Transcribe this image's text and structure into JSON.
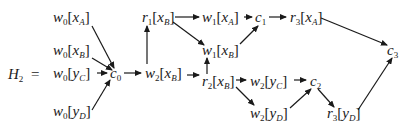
{
  "equation": {
    "lhs": "H",
    "lhs_sub": "2",
    "equals": "="
  },
  "nodes": [
    {
      "id": "w0xA",
      "op": "w",
      "sub": "0",
      "var": "x",
      "vsub": "A",
      "x": 53,
      "y": 22
    },
    {
      "id": "w0xB",
      "op": "w",
      "sub": "0",
      "var": "x",
      "vsub": "B",
      "x": 53,
      "y": 55
    },
    {
      "id": "w0yC",
      "op": "w",
      "sub": "0",
      "var": "y",
      "vsub": "C",
      "x": 53,
      "y": 78
    },
    {
      "id": "w0yD",
      "op": "w",
      "sub": "0",
      "var": "y",
      "vsub": "D",
      "x": 53,
      "y": 116
    },
    {
      "id": "c0",
      "op": "c",
      "sub": "0",
      "x": 110,
      "y": 78
    },
    {
      "id": "w2xB",
      "op": "w",
      "sub": "2",
      "var": "x",
      "vsub": "B",
      "x": 145,
      "y": 78
    },
    {
      "id": "r1xB",
      "op": "r",
      "sub": "1",
      "var": "x",
      "vsub": "B",
      "x": 142,
      "y": 22
    },
    {
      "id": "w1xA",
      "op": "w",
      "sub": "1",
      "var": "x",
      "vsub": "A",
      "x": 202,
      "y": 22
    },
    {
      "id": "c1",
      "op": "c",
      "sub": "1",
      "x": 255,
      "y": 22
    },
    {
      "id": "r3xA",
      "op": "r",
      "sub": "3",
      "var": "x",
      "vsub": "A",
      "x": 290,
      "y": 22
    },
    {
      "id": "w1xB",
      "op": "w",
      "sub": "1",
      "var": "x",
      "vsub": "B",
      "x": 202,
      "y": 55
    },
    {
      "id": "r2xB",
      "op": "r",
      "sub": "2",
      "var": "x",
      "vsub": "B",
      "x": 202,
      "y": 86
    },
    {
      "id": "w2yC",
      "op": "w",
      "sub": "2",
      "var": "y",
      "vsub": "C",
      "x": 250,
      "y": 86
    },
    {
      "id": "c2",
      "op": "c",
      "sub": "2",
      "x": 310,
      "y": 86
    },
    {
      "id": "w2yD",
      "op": "w",
      "sub": "2",
      "var": "y",
      "vsub": "D",
      "x": 250,
      "y": 118
    },
    {
      "id": "r3yD",
      "op": "r",
      "sub": "3",
      "var": "y",
      "vsub": "D",
      "x": 327,
      "y": 118
    },
    {
      "id": "c3",
      "op": "c",
      "sub": "3",
      "x": 387,
      "y": 55
    }
  ],
  "edges": [
    {
      "from": "w0xA",
      "to": "c0",
      "x1": 92,
      "y1": 26,
      "x2": 114,
      "y2": 68
    },
    {
      "from": "w0xB",
      "to": "c0",
      "x1": 92,
      "y1": 58,
      "x2": 112,
      "y2": 70
    },
    {
      "from": "w0yC",
      "to": "c0",
      "x1": 97,
      "y1": 73,
      "x2": 107,
      "y2": 73
    },
    {
      "from": "w0yD",
      "to": "c0",
      "x1": 92,
      "y1": 110,
      "x2": 110,
      "y2": 80
    },
    {
      "from": "c0",
      "to": "w2xB",
      "x1": 124,
      "y1": 73,
      "x2": 141,
      "y2": 73
    },
    {
      "from": "w2xB",
      "to": "r1xB",
      "x1": 147,
      "y1": 64,
      "x2": 147,
      "y2": 26
    },
    {
      "from": "w2xB",
      "to": "r2xB",
      "x1": 187,
      "y1": 75,
      "x2": 199,
      "y2": 75
    },
    {
      "from": "r1xB",
      "to": "w1xA",
      "x1": 175,
      "y1": 17,
      "x2": 199,
      "y2": 17
    },
    {
      "from": "r1xB",
      "to": "w1xB",
      "x1": 173,
      "y1": 22,
      "x2": 204,
      "y2": 45
    },
    {
      "from": "w1xA",
      "to": "c1",
      "x1": 244,
      "y1": 17,
      "x2": 252,
      "y2": 17
    },
    {
      "from": "w1xB",
      "to": "c1",
      "x1": 240,
      "y1": 44,
      "x2": 258,
      "y2": 26
    },
    {
      "from": "c1",
      "to": "r3xA",
      "x1": 269,
      "y1": 17,
      "x2": 286,
      "y2": 17
    },
    {
      "from": "r2xB",
      "to": "w1xB",
      "x1": 207,
      "y1": 74,
      "x2": 207,
      "y2": 58
    },
    {
      "from": "r2xB",
      "to": "w2yC",
      "x1": 236,
      "y1": 80,
      "x2": 246,
      "y2": 80
    },
    {
      "from": "r2xB",
      "to": "w2yD",
      "x1": 236,
      "y1": 87,
      "x2": 254,
      "y2": 105
    },
    {
      "from": "w2yC",
      "to": "c2",
      "x1": 294,
      "y1": 80,
      "x2": 306,
      "y2": 80
    },
    {
      "from": "w2yD",
      "to": "c2",
      "x1": 290,
      "y1": 108,
      "x2": 311,
      "y2": 89
    },
    {
      "from": "c2",
      "to": "r3yD",
      "x1": 318,
      "y1": 89,
      "x2": 334,
      "y2": 107
    },
    {
      "from": "r3xA",
      "to": "c3",
      "x1": 321,
      "y1": 18,
      "x2": 387,
      "y2": 45
    },
    {
      "from": "r3yD",
      "to": "c3",
      "x1": 358,
      "y1": 110,
      "x2": 392,
      "y2": 58
    }
  ]
}
